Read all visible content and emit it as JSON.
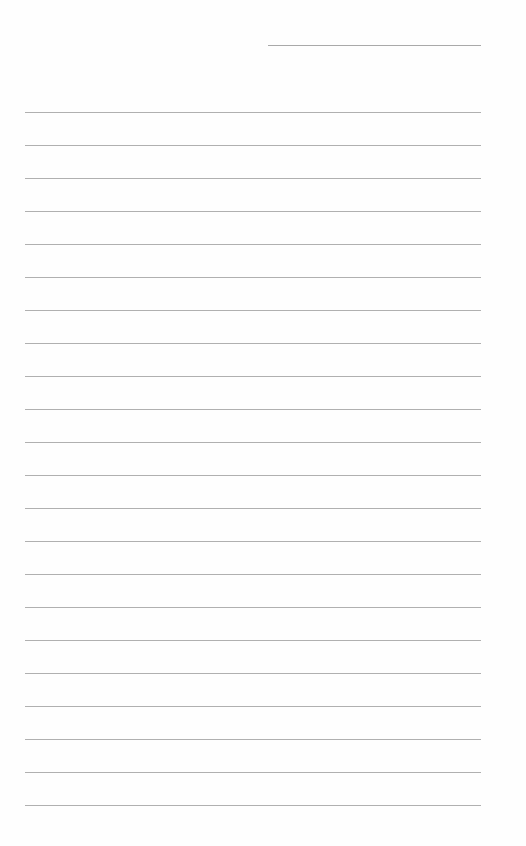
{
  "page": {
    "type": "blank-ruled-sheet",
    "background_color": "#fefefe",
    "line_color": "#b0b0b0"
  },
  "header_line": {
    "x": 268,
    "y": 45,
    "width": 213,
    "text": ""
  },
  "ruled_lines": {
    "count": 22,
    "x": 25,
    "width": 456,
    "first_y": 112,
    "spacing": 33,
    "entries": [
      "",
      "",
      "",
      "",
      "",
      "",
      "",
      "",
      "",
      "",
      "",
      "",
      "",
      "",
      "",
      "",
      "",
      "",
      "",
      "",
      "",
      ""
    ]
  }
}
